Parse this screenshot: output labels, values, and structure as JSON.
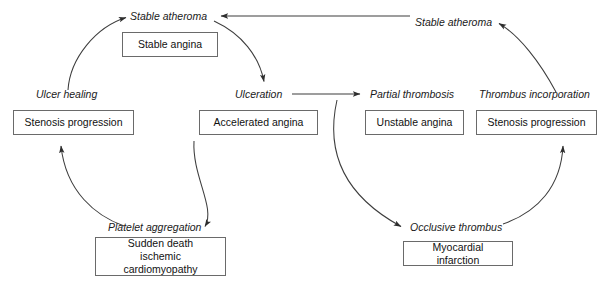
{
  "diagram": {
    "stroke_color": "#3d3d3d",
    "box_border_color": "#6a6a6a",
    "background_color": "#ffffff",
    "text_color": "#111111"
  },
  "states": [
    {
      "id": "stable-atheroma-left",
      "label": "Stable atheroma"
    },
    {
      "id": "stable-atheroma-right",
      "label": "Stable atheroma"
    },
    {
      "id": "ulcer-healing",
      "label": "Ulcer healing"
    },
    {
      "id": "ulceration",
      "label": "Ulceration"
    },
    {
      "id": "partial-thrombosis",
      "label": "Partial thrombosis"
    },
    {
      "id": "thrombus-incorporation",
      "label": "Thrombus incorporation"
    },
    {
      "id": "platelet-aggregation",
      "label": "Platelet aggregation"
    },
    {
      "id": "occlusive-thrombus",
      "label": "Occlusive thrombus"
    }
  ],
  "outcomes": [
    {
      "id": "stable-angina",
      "label": "Stable angina"
    },
    {
      "id": "stenosis-progression-left",
      "label": "Stenosis progression"
    },
    {
      "id": "accelerated-angina",
      "label": "Accelerated angina"
    },
    {
      "id": "unstable-angina",
      "label": "Unstable angina"
    },
    {
      "id": "stenosis-progression-right",
      "label": "Stenosis progression"
    },
    {
      "id": "sudden-death",
      "label": "Sudden death\nischemic cardiomyopathy"
    },
    {
      "id": "myocardial-infarction",
      "label": "Myocardial infarction"
    }
  ],
  "flows": [
    {
      "from": "ulcer-healing",
      "to": "stable-atheroma-left"
    },
    {
      "from": "stable-atheroma-left",
      "to": "ulceration"
    },
    {
      "from": "ulceration",
      "to": "platelet-aggregation"
    },
    {
      "from": "platelet-aggregation",
      "to": "stenosis-progression-left"
    },
    {
      "from": "ulceration",
      "to": "partial-thrombosis"
    },
    {
      "from": "partial-thrombosis",
      "to": "occlusive-thrombus"
    },
    {
      "from": "occlusive-thrombus",
      "to": "stenosis-progression-right"
    },
    {
      "from": "thrombus-incorporation",
      "to": "stable-atheroma-right"
    },
    {
      "from": "stable-atheroma-right",
      "to": "stable-atheroma-left"
    }
  ]
}
